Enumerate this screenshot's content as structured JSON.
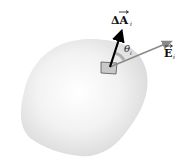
{
  "diagram": {
    "type": "gauss-law-surface-element",
    "surface": {
      "fill_center": "#ffffff",
      "fill_edge": "#dcdcdc"
    },
    "area_element": {
      "fill": "#c8c8c8",
      "stroke": "#555555"
    },
    "vectors": {
      "area": {
        "symbol": "ΔA",
        "subscript": "i",
        "color": "#000000"
      },
      "field": {
        "symbol": "E",
        "subscript": "i",
        "color": "#8a8a8a"
      }
    },
    "angle": {
      "symbol": "θ",
      "subscript": "i"
    }
  }
}
